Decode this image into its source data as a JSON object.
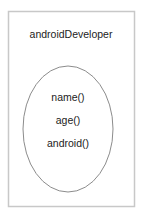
{
  "diagram": {
    "class_name": "androidDeveloper",
    "methods": [
      "name()",
      "age()",
      "android()"
    ],
    "colors": {
      "box_stroke": "#c8c8c8",
      "ellipse_stroke": "#8c8c8c",
      "text": "#222222"
    }
  }
}
